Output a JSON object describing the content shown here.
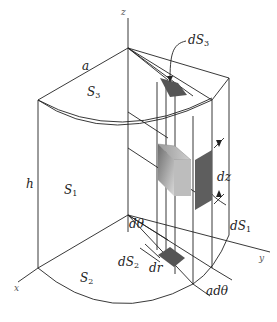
{
  "figure": {
    "axes": {
      "x": "x",
      "y": "y",
      "z": "z"
    },
    "labels": {
      "a": "a",
      "h": "h",
      "S1": {
        "base": "S",
        "sub": "1"
      },
      "S2": {
        "base": "S",
        "sub": "2"
      },
      "S3": {
        "base": "S",
        "sub": "3"
      },
      "dS1": {
        "base": "dS",
        "sub": "1"
      },
      "dS2": {
        "base": "dS",
        "sub": "2"
      },
      "dS3": {
        "base": "dS",
        "sub": "3"
      },
      "dz": "dz",
      "dr": "dr",
      "dtheta": "dθ",
      "adtheta": "adθ"
    },
    "colors": {
      "line": "#222222",
      "element_dark": "#555555",
      "element_mid": "#8a8a8a",
      "element_light": "#c8c8c8"
    }
  }
}
